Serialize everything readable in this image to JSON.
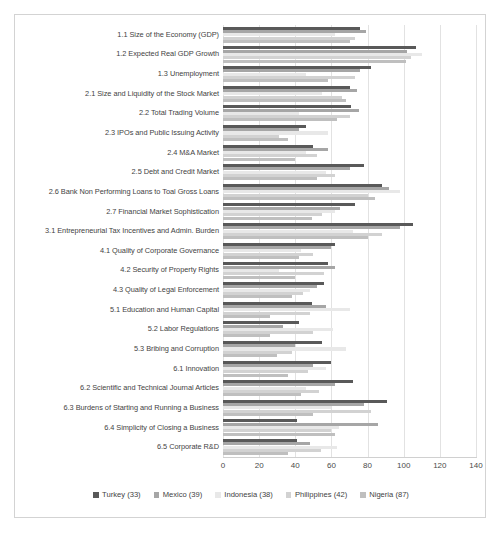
{
  "chart_data": {
    "type": "bar",
    "orientation": "horizontal",
    "title": "",
    "subtitle": "",
    "xlabel": "",
    "ylabel": "",
    "xlim": [
      0,
      140
    ],
    "xticks": [
      0,
      20,
      40,
      60,
      80,
      100,
      120,
      140
    ],
    "grid": true,
    "legend_position": "bottom",
    "categories": [
      "1.1 Size of the Economy (GDP)",
      "1.2 Expected Real GDP Growth",
      "1.3 Unemployment",
      "2.1 Size and Liquidity of the Stock Market",
      "2.2 Total Trading Volume",
      "2.3 IPOs and Public Issuing Activity",
      "2.4 M&A Market",
      "2.5 Debt and Credit Market",
      "2.6 Bank Non Performing Loans to Toal Gross Loans",
      "2.7 Financial Market Sophistication",
      "3.1 Entrepreneurial Tax Incentives and Admin. Burden",
      "4.1 Quality of Corporate Governance",
      "4.2 Security of Property Rights",
      "4.3 Quality of Legal Enforcement",
      "5.1 Education and Human Capital",
      "5.2 Labor Regulations",
      "5.3 Bribing and Corruption",
      "6.1 Innovation",
      "6.2 Scientific and Technical Journal Articles",
      "6.3 Burdens of Starting and Running a Business",
      "6.4 Simplicity of Closing a Business",
      "6.5 Corporate R&D"
    ],
    "series": [
      {
        "name": "Turkey (33)",
        "color": "#595959",
        "values": [
          76,
          107,
          82,
          70,
          71,
          46,
          50,
          78,
          88,
          73,
          105,
          62,
          58,
          56,
          49,
          42,
          55,
          60,
          72,
          91,
          41,
          41
        ]
      },
      {
        "name": "Mexico (39)",
        "color": "#a6a6a6",
        "values": [
          79,
          102,
          76,
          74,
          75,
          42,
          58,
          70,
          92,
          65,
          98,
          60,
          62,
          52,
          57,
          33,
          40,
          50,
          62,
          78,
          86,
          48
        ]
      },
      {
        "name": "Indonesia (38)",
        "color": "#e8e8e8",
        "values": [
          62,
          110,
          46,
          55,
          42,
          58,
          46,
          57,
          98,
          62,
          72,
          43,
          31,
          48,
          70,
          61,
          68,
          57,
          46,
          60,
          64,
          63
        ]
      },
      {
        "name": "Philippines (42)",
        "color": "#d2d2d2",
        "values": [
          73,
          104,
          73,
          66,
          70,
          31,
          52,
          62,
          80,
          55,
          88,
          50,
          56,
          44,
          48,
          50,
          38,
          47,
          53,
          82,
          60,
          54
        ]
      },
      {
        "name": "Nigeria (87)",
        "color": "#bfbfbf",
        "values": [
          70,
          101,
          58,
          68,
          63,
          36,
          40,
          52,
          84,
          49,
          80,
          42,
          40,
          38,
          26,
          26,
          30,
          36,
          43,
          50,
          62,
          36
        ]
      }
    ]
  }
}
